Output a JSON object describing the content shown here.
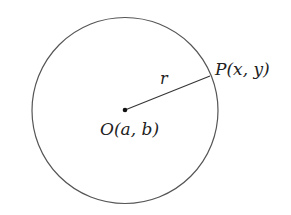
{
  "diagram": {
    "type": "circle-with-radius",
    "center": {
      "label": "O(a, b)",
      "x": 125,
      "y": 110
    },
    "radius": {
      "label": "r",
      "value_px": 93
    },
    "point": {
      "label": "P(x, y)",
      "x": 210,
      "y": 76
    },
    "colors": {
      "stroke": "#555555",
      "text": "#222222",
      "background": "#ffffff"
    }
  }
}
